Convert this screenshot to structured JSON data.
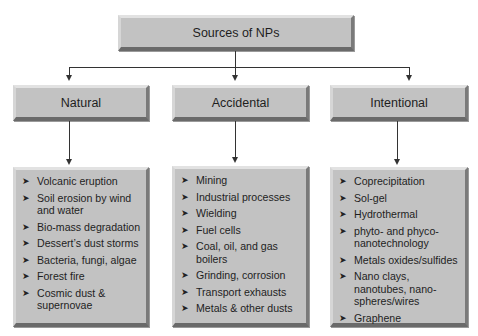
{
  "diagram": {
    "root": {
      "label": "Sources of NPs"
    },
    "categories": [
      {
        "label": "Natural",
        "items": [
          "Volcanic eruption",
          "Soil erosion by wind and water",
          "Bio-mass degradation",
          "Dessert’s dust storms",
          "Bacteria,  fungi, algae",
          "Forest fire",
          "Cosmic dust & supernovae"
        ]
      },
      {
        "label": "Accidental",
        "items": [
          "Mining",
          "Industrial processes",
          "Wielding",
          "Fuel cells",
          "Coal, oil, and gas boilers",
          "Grinding, corrosion",
          "Transport exhausts",
          "Metals & other dusts"
        ]
      },
      {
        "label": "Intentional",
        "items": [
          "Coprecipitation",
          "Sol-gel",
          "Hydrothermal",
          "phyto- and phyco-nanotechnology",
          "Metals oxides/sulfides",
          "Nano clays, nanotubes, nano-spheres/wires",
          "Graphene"
        ]
      }
    ],
    "bullet_glyph": "➤",
    "colors": {
      "box_fill": "#c2c2c2",
      "line": "#333333",
      "background": "#ffffff"
    }
  }
}
